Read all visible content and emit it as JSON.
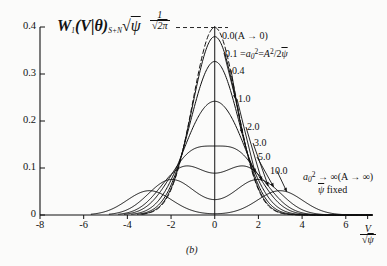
{
  "figure": {
    "caption": "(b)",
    "background_color": "#fbfbfa",
    "ink_color": "#111111"
  },
  "axes": {
    "y_label_parts": {
      "w": "W",
      "w_sub": "1",
      "open": "(",
      "v": "V",
      "bar": "|",
      "theta": "θ",
      "close": ")",
      "sn_sub": "S+N",
      "sqrt": "√",
      "psi": "ψ"
    },
    "x_label_num": "V",
    "x_label_den_radical": "√",
    "x_label_den_sym": "ψ",
    "y_ticks": [
      "0",
      "0.1",
      "0.2",
      "0.3",
      "0.4"
    ],
    "y_tick_values": [
      0,
      0.1,
      0.2,
      0.3,
      0.4
    ],
    "x_ticks": [
      "-8",
      "-6",
      "-4",
      "-2",
      "0",
      "2",
      "4",
      "6"
    ],
    "x_tick_values": [
      -8,
      -6,
      -4,
      -2,
      0,
      2,
      4,
      6
    ],
    "xlim": [
      -8,
      7.2
    ],
    "ylim": [
      0,
      0.42
    ],
    "grid": false
  },
  "annotations": {
    "peak_label_num": "1",
    "peak_label_radical": "√",
    "peak_label_den": "2π",
    "limit_zero": "0.0(A → 0)",
    "param_def_prefix": "0.1 =",
    "param_def_a0": "a",
    "param_def_a0_sub": "0",
    "param_def_a0_sup": "2",
    "param_def_eq": "=",
    "param_def_A": "A",
    "param_def_A_sup": "2",
    "param_def_den": "/2",
    "param_def_psi": "ψ",
    "limit_inf_a0": "a",
    "limit_inf_a0_sub": "0",
    "limit_inf_a0_sup": "2",
    "limit_inf_arrow": "→ ∞(A → ∞)",
    "psi_fixed_sym": "ψ",
    "psi_fixed_text": "fixed"
  },
  "chart_data": {
    "type": "line",
    "title": "",
    "subtitle": "",
    "xlabel": "V/√ψ",
    "ylabel": "W₁(V|θ)_{S+N}√ψ",
    "xlim": [
      -8,
      7.2
    ],
    "ylim": [
      0,
      0.42
    ],
    "xticks": [
      -8,
      -6,
      -4,
      -2,
      0,
      2,
      4,
      6
    ],
    "yticks": [
      0,
      0.1,
      0.2,
      0.3,
      0.4
    ],
    "grid": false,
    "legend_position": "inline-annotations",
    "parameter_name": "a0^2",
    "parameter_definition": "a0^2 = A^2 / (2*psi)",
    "peak_reference_value": 0.3989,
    "peak_reference_label": "1/sqrt(2*pi)",
    "series": [
      {
        "name": "0.0",
        "a0_sq": 0.0,
        "style": "dashed",
        "label": "0.0(A → 0)",
        "peak_y": 0.3989,
        "peak_x": 0.0,
        "bimodal": false
      },
      {
        "name": "0.1",
        "a0_sq": 0.1,
        "style": "solid",
        "label": "0.1 = a0^2 = A^2/2ψ",
        "peak_y": 0.3945,
        "peak_x": 0.0,
        "bimodal": false
      },
      {
        "name": "0.4",
        "a0_sq": 0.4,
        "style": "solid",
        "label": "0.4",
        "peak_y": 0.3816,
        "peak_x": 0.0,
        "bimodal": false
      },
      {
        "name": "1.0",
        "a0_sq": 1.0,
        "style": "solid",
        "label": "1.0",
        "peak_y": 0.3434,
        "peak_x": 0.0,
        "bimodal": false
      },
      {
        "name": "2.0",
        "a0_sq": 2.0,
        "style": "solid",
        "label": "2.0",
        "peak_y": 0.2834,
        "peak_x": 0.0,
        "bimodal": false
      },
      {
        "name": "3.0",
        "a0_sq": 3.0,
        "style": "solid",
        "label": "3.0",
        "peak_y": 0.2311,
        "peak_x": 0.0,
        "bimodal": true
      },
      {
        "name": "5.0",
        "a0_sq": 5.0,
        "style": "solid",
        "label": "5.0",
        "peak_y": 0.1758,
        "peak_x": 2.05,
        "bimodal": true
      },
      {
        "name": "10.0",
        "a0_sq": 10.0,
        "style": "solid",
        "label": "10.0",
        "peak_y": 0.1237,
        "peak_x": 3.45,
        "bimodal": true
      }
    ],
    "note": "Symmetric two-sided envelope densities; each curve v -> 0.5*exp(-(v^2+a0^2)/2)*I0(a0*|v|) scaled; dashed curve is the Gaussian limit a0^2 -> 0 with peak 1/sqrt(2pi) = 0.3989. As a0^2 increases the density becomes bimodal with lobes near |v| = a0."
  }
}
